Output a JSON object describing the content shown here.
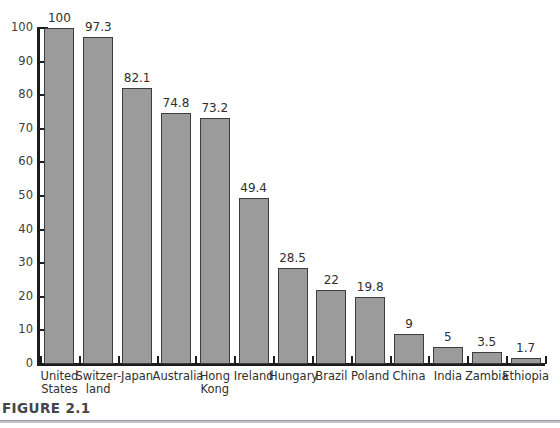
{
  "figure": {
    "caption_label": "FIGURE 2.1"
  },
  "chart_data": {
    "type": "bar",
    "title": "",
    "xlabel": "",
    "ylabel": "",
    "ylim": [
      0,
      100
    ],
    "grid": false,
    "legend": "none",
    "bar_color": "#9b9b9b",
    "bar_border_color": "#3d3d3d",
    "axis_color": "#1c1c1c",
    "categories": [
      "United States",
      "Switzerland",
      "Japan",
      "Australia",
      "Hong Kong",
      "Ireland",
      "Hungary",
      "Brazil",
      "Poland",
      "China",
      "India",
      "Zambia",
      "Ethiopia"
    ],
    "category_lines": [
      [
        "United",
        "States"
      ],
      [
        "Switzer-",
        "land"
      ],
      [
        "Japan"
      ],
      [
        "Australia"
      ],
      [
        "Hong",
        "Kong"
      ],
      [
        "Ireland"
      ],
      [
        "Hungary"
      ],
      [
        "Brazil"
      ],
      [
        "Poland"
      ],
      [
        "China"
      ],
      [
        "India"
      ],
      [
        "Zambia"
      ],
      [
        "Ethiopia"
      ]
    ],
    "values": [
      100,
      97.3,
      82.1,
      74.8,
      73.2,
      49.4,
      28.5,
      22,
      19.8,
      9,
      5,
      3.5,
      1.7
    ],
    "value_labels": [
      "100",
      "97.3",
      "82.1",
      "74.8",
      "73.2",
      "49.4",
      "28.5",
      "22",
      "19.8",
      "9",
      "5",
      "3.5",
      "1.7"
    ],
    "yticks": [
      0,
      10,
      20,
      30,
      40,
      50,
      60,
      70,
      80,
      90,
      100
    ],
    "ytick_labels": [
      "0",
      "10",
      "20",
      "30",
      "40",
      "50",
      "60",
      "70",
      "80",
      "90",
      "100"
    ]
  }
}
